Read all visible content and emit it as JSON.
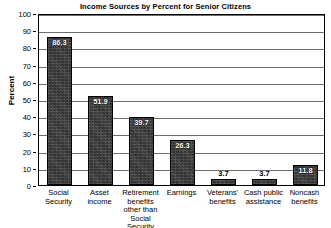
{
  "chart_data": {
    "type": "bar",
    "title": "Income Sources by Percent for Senior Citizens",
    "xlabel": "",
    "ylabel": "Percent",
    "ylim": [
      0,
      100
    ],
    "yticks": [
      0,
      10,
      20,
      30,
      40,
      50,
      60,
      70,
      80,
      90,
      100
    ],
    "grid": true,
    "legend": "none",
    "categories": [
      "Social Security",
      "Asset income",
      "Retirement benefits other than Social Security",
      "Earnings",
      "Veterans' benefits",
      "Cash public assistance",
      "Noncash benefits"
    ],
    "category_lines": [
      [
        "Social",
        "Security"
      ],
      [
        "Asset",
        "income"
      ],
      [
        "Retirement",
        "benefits",
        "other than",
        "Social Security"
      ],
      [
        "Earnings"
      ],
      [
        "Veterans'",
        "benefits"
      ],
      [
        "Cash public",
        "assistance"
      ],
      [
        "Noncash",
        "benefits"
      ]
    ],
    "values": [
      86.3,
      51.9,
      39.7,
      26.3,
      3.7,
      3.7,
      11.8
    ],
    "value_labels": [
      "86.3",
      "51.9",
      "39.7",
      "26.3",
      "3.7",
      "3.7",
      "11.8"
    ],
    "label_placement": [
      "inside",
      "inside",
      "inside",
      "inside",
      "outside",
      "outside",
      "inside"
    ],
    "bar_color": "#3a3a3a",
    "axis_color": "#000000",
    "grid_color": "#6e6e6e",
    "background": "#ffffff"
  }
}
